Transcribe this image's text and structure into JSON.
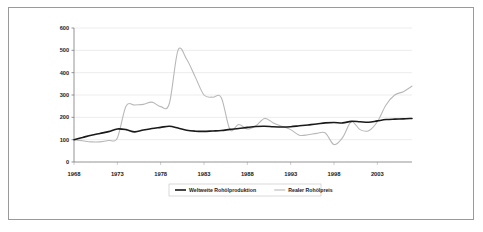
{
  "figure": {
    "title": "",
    "border_color": "#9a9a9a",
    "background": "#ffffff"
  },
  "legend": {
    "position": "bottom-center",
    "entries": [
      {
        "label": "Weltweite Rohölproduktion",
        "color": "#1a1a1a",
        "width": 1.6
      },
      {
        "label": "Realer Rohölpreis",
        "color": "#b8b8b8",
        "width": 1.1
      }
    ]
  },
  "chart_data": {
    "type": "line",
    "title": "",
    "xlabel": "",
    "ylabel": "",
    "xlim": [
      1968,
      2007
    ],
    "ylim": [
      0,
      600
    ],
    "ytick_labels": [
      "0",
      "100",
      "200",
      "300",
      "400",
      "500",
      "600"
    ],
    "yticks": [
      0,
      100,
      200,
      300,
      400,
      500,
      600
    ],
    "xtick_labels": [
      "1968",
      "1973",
      "1978",
      "1983",
      "1988",
      "1993",
      "1998",
      "2003"
    ],
    "xticks": [
      1968,
      1973,
      1978,
      1983,
      1988,
      1993,
      1998,
      2003
    ],
    "grid": "horizontal",
    "x": [
      1968,
      1969,
      1970,
      1971,
      1972,
      1973,
      1974,
      1975,
      1976,
      1977,
      1978,
      1979,
      1980,
      1981,
      1982,
      1983,
      1984,
      1985,
      1986,
      1987,
      1988,
      1989,
      1990,
      1991,
      1992,
      1993,
      1994,
      1995,
      1996,
      1997,
      1998,
      1999,
      2000,
      2001,
      2002,
      2003,
      2004,
      2005,
      2006,
      2007
    ],
    "series": [
      {
        "name": "Weltweite Rohölproduktion",
        "color": "#1a1a1a",
        "values": [
          100,
          110,
          120,
          128,
          136,
          148,
          145,
          135,
          143,
          150,
          155,
          160,
          152,
          142,
          138,
          137,
          139,
          141,
          146,
          150,
          155,
          159,
          160,
          158,
          157,
          158,
          162,
          166,
          170,
          175,
          177,
          175,
          182,
          180,
          178,
          184,
          190,
          192,
          193,
          195
        ]
      },
      {
        "name": "Realer Rohölpreis",
        "color": "#b8b8b8",
        "values": [
          100,
          95,
          90,
          90,
          96,
          108,
          250,
          255,
          258,
          268,
          248,
          262,
          500,
          460,
          380,
          300,
          290,
          288,
          145,
          168,
          148,
          163,
          195,
          175,
          160,
          145,
          120,
          122,
          128,
          130,
          78,
          110,
          180,
          145,
          140,
          180,
          255,
          300,
          315,
          340
        ]
      }
    ],
    "annotations": [
      {
        "text": "peak",
        "x": 1980,
        "y": 500
      },
      {
        "text": "trough",
        "x": 1998,
        "y": 78
      }
    ]
  }
}
